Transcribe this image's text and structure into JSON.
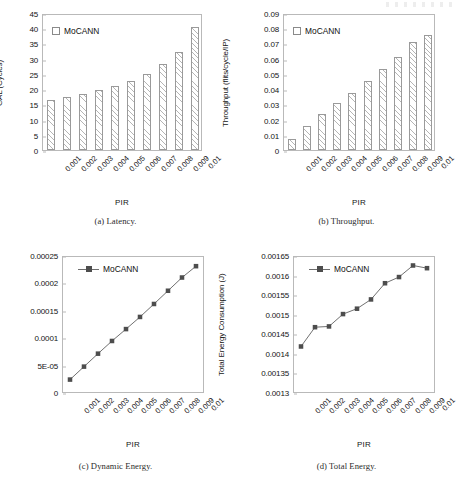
{
  "legend_label": "MoCANN",
  "xlabel": "PIR",
  "categories": [
    "0.001",
    "0.002",
    "0.003",
    "0.004",
    "0.005",
    "0.006",
    "0.007",
    "0.008",
    "0.009",
    "0.01"
  ],
  "captions": {
    "a": "(a) Latency.",
    "b": "(b) Throughput.",
    "c": "(c) Dynamic Energy.",
    "d": "(d) Total Energy."
  },
  "colors": {
    "bar_edge": "#9a9a9a",
    "bar_fill": "#ffffff",
    "hatch": "#787878",
    "line": "#6e6e6e",
    "marker": "#4d4d4d",
    "frame": "#b9b9b9",
    "text": "#141414"
  },
  "chart_data": [
    {
      "id": "latency",
      "type": "bar",
      "title": "(a) Latency.",
      "xlabel": "PIR",
      "ylabel": "GAL (Cycles)",
      "categories": [
        "0.001",
        "0.002",
        "0.003",
        "0.004",
        "0.005",
        "0.006",
        "0.007",
        "0.008",
        "0.009",
        "0.01"
      ],
      "series": [
        {
          "name": "MoCANN",
          "values": [
            16.5,
            17.3,
            18.5,
            19.7,
            21.0,
            22.8,
            25.1,
            28.2,
            32.3,
            40.3
          ]
        }
      ],
      "ylim": [
        0,
        45
      ],
      "yticks": [
        0,
        5,
        10,
        15,
        20,
        25,
        30,
        35,
        40,
        45
      ],
      "ytick_labels": [
        "0",
        "5",
        "10",
        "15",
        "20",
        "25",
        "30",
        "35",
        "40",
        "45"
      ],
      "grid": false,
      "legend_position": "top-left"
    },
    {
      "id": "throughput",
      "type": "bar",
      "title": "(b) Throughput.",
      "xlabel": "PIR",
      "ylabel": "Throughput (flits/cycle/IP)",
      "categories": [
        "0.001",
        "0.002",
        "0.003",
        "0.004",
        "0.005",
        "0.006",
        "0.007",
        "0.008",
        "0.009",
        "0.01"
      ],
      "series": [
        {
          "name": "MoCANN",
          "values": [
            0.0073,
            0.0155,
            0.0237,
            0.0308,
            0.0375,
            0.0455,
            0.0535,
            0.0613,
            0.071,
            0.0755
          ]
        }
      ],
      "ylim": [
        0,
        0.09
      ],
      "yticks": [
        0,
        0.01,
        0.02,
        0.03,
        0.04,
        0.05,
        0.06,
        0.07,
        0.08,
        0.09
      ],
      "ytick_labels": [
        "0",
        "0.01",
        "0.02",
        "0.03",
        "0.04",
        "0.05",
        "0.06",
        "0.07",
        "0.08",
        "0.09"
      ],
      "grid": false,
      "legend_position": "top-left"
    },
    {
      "id": "dynamic-energy",
      "type": "line",
      "title": "(c) Dynamic Energy.",
      "xlabel": "PIR",
      "ylabel": "Dyn. Energy Consumption (J)",
      "categories": [
        "0.001",
        "0.002",
        "0.003",
        "0.004",
        "0.005",
        "0.006",
        "0.007",
        "0.008",
        "0.009",
        "0.01"
      ],
      "series": [
        {
          "name": "MoCANN",
          "values": [
            2.3e-05,
            4.7e-05,
            7.1e-05,
            9.45e-05,
            0.0001165,
            0.000139,
            0.000163,
            0.0001875,
            0.000212,
            0.000233
          ]
        }
      ],
      "ylim": [
        0,
        0.00025
      ],
      "yticks": [
        0,
        5e-05,
        0.0001,
        0.00015,
        0.0002,
        0.00025
      ],
      "ytick_labels": [
        "0",
        "5E-05",
        "0.0001",
        "0.00015",
        "0.0002",
        "0.00025"
      ],
      "grid": false,
      "legend_position": "top-left"
    },
    {
      "id": "total-energy",
      "type": "line",
      "title": "(d) Total Energy.",
      "xlabel": "PIR",
      "ylabel": "Total Energy Consumption (J)",
      "categories": [
        "0.001",
        "0.002",
        "0.003",
        "0.004",
        "0.005",
        "0.006",
        "0.007",
        "0.008",
        "0.009",
        "0.01"
      ],
      "series": [
        {
          "name": "MoCANN",
          "values": [
            0.001418,
            0.001468,
            0.00147,
            0.001502,
            0.001516,
            0.00154,
            0.001582,
            0.001598,
            0.001628,
            0.001621
          ]
        }
      ],
      "ylim": [
        0.0013,
        0.00165
      ],
      "yticks": [
        0.0013,
        0.00135,
        0.0014,
        0.00145,
        0.0015,
        0.00155,
        0.0016,
        0.00165
      ],
      "ytick_labels": [
        "0.0013",
        "0.00135",
        "0.0014",
        "0.00145",
        "0.0015",
        "0.00155",
        "0.0016",
        "0.00165"
      ],
      "grid": false,
      "legend_position": "top-left"
    }
  ]
}
